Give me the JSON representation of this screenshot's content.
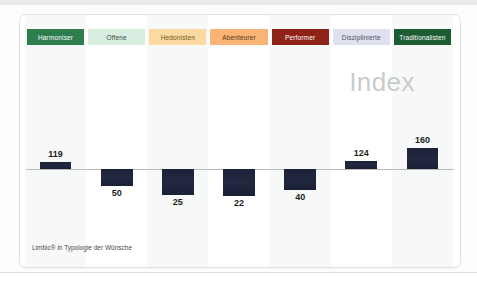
{
  "slide": {
    "watermark": "Index",
    "footnote": "Limbic® in Typologie der Wünsche"
  },
  "chart_data": {
    "type": "bar",
    "title": "Index",
    "subtitle": "",
    "xlabel": "",
    "ylabel": "",
    "baseline": 100,
    "grid": false,
    "legend_position": "top",
    "categories": [
      "Harmoniser",
      "Offene",
      "Hedonisten",
      "Abenteurer",
      "Performer",
      "Disziplinierte",
      "Traditionalisten"
    ],
    "values": [
      119,
      50,
      25,
      22,
      40,
      124,
      160
    ],
    "value_labels": [
      "119",
      "50",
      "25",
      "22",
      "40",
      "124",
      "160"
    ],
    "bar_color": "#1f2740",
    "category_colors": [
      "#2e7d4f",
      "#d9ece0",
      "#fbd9a0",
      "#f8b375",
      "#8f2318",
      "#dfe1ef",
      "#1d5b32"
    ],
    "category_text_colors": [
      "#ffffff",
      "#3c4a43",
      "#6b5523",
      "#5c3a18",
      "#ffffff",
      "#4a4f63",
      "#ffffff"
    ]
  }
}
